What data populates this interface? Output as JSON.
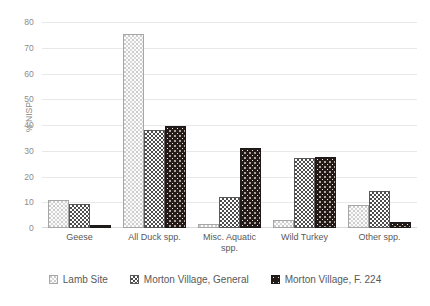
{
  "chart_data": {
    "type": "bar",
    "title": "",
    "subtitle": "",
    "xlabel": "",
    "ylabel": "% NISP",
    "ylim": [
      0,
      80
    ],
    "ytick_step": 10,
    "yticks": [
      "0",
      "10",
      "20",
      "30",
      "40",
      "50",
      "60",
      "70",
      "80"
    ],
    "grid": true,
    "grid_axis": "y",
    "legend_position": "bottom",
    "categories": [
      "Geese",
      "All Duck spp.",
      "Misc. Aquatic spp.",
      "Wild Turkey",
      "Other spp."
    ],
    "category_lines": [
      [
        "Geese"
      ],
      [
        "All Duck spp."
      ],
      [
        "Misc. Aquatic",
        "spp."
      ],
      [
        "Wild Turkey"
      ],
      [
        "Other spp."
      ]
    ],
    "series": [
      {
        "name": "Lamb Site",
        "pattern": "light-dotted",
        "color": "#fbfbfb",
        "edge_color": "#a6a6a6",
        "values": [
          11.0,
          75.5,
          1.5,
          3.0,
          9.0
        ]
      },
      {
        "name": "Morton Village, General",
        "pattern": "gray-checkerboard",
        "color": "#808080",
        "edge_color": "#595959",
        "values": [
          9.5,
          38.0,
          12.0,
          27.0,
          14.5
        ]
      },
      {
        "name": "Morton Village, F. 224",
        "pattern": "dark-speckled",
        "color": "#241a17",
        "edge_color": "#1a1a1a",
        "values": [
          1.0,
          39.5,
          31.0,
          27.5,
          2.5
        ]
      }
    ]
  },
  "legend": {
    "items": [
      {
        "label": "Lamb Site"
      },
      {
        "label": "Morton Village, General"
      },
      {
        "label": "Morton Village, F. 224"
      }
    ]
  }
}
